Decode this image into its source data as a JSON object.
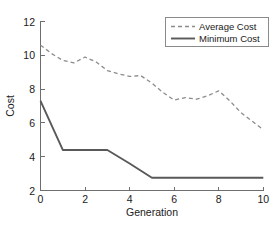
{
  "chart_data": {
    "type": "line",
    "title": "",
    "xlabel": "Generation",
    "ylabel": "Cost",
    "xlim": [
      0,
      10
    ],
    "ylim": [
      2,
      12
    ],
    "xticks": [
      0,
      2,
      4,
      6,
      8,
      10
    ],
    "yticks": [
      2,
      4,
      6,
      8,
      10,
      12
    ],
    "xtick_labels": [
      "0",
      "2",
      "4",
      "6",
      "8",
      "10"
    ],
    "ytick_labels": [
      "2",
      "4",
      "6",
      "8",
      "10",
      "12"
    ],
    "grid": false,
    "legend_position": "top-right",
    "series": [
      {
        "name": "Average Cost",
        "style": "dashed",
        "color": "#8c8c8c",
        "x": [
          0,
          0.5,
          1.0,
          1.5,
          2.0,
          2.5,
          3.0,
          3.5,
          4.0,
          4.5,
          5.0,
          5.5,
          6.0,
          6.5,
          7.0,
          7.5,
          8.0,
          8.5,
          9.0,
          9.5,
          10.0
        ],
        "values": [
          10.6,
          10.1,
          9.7,
          9.55,
          9.9,
          9.6,
          9.1,
          8.9,
          8.75,
          8.8,
          8.35,
          7.8,
          7.35,
          7.5,
          7.4,
          7.6,
          7.9,
          7.3,
          6.6,
          6.1,
          5.6
        ]
      },
      {
        "name": "Minimum Cost",
        "style": "solid",
        "color": "#595959",
        "x": [
          0,
          1,
          2,
          3,
          4,
          5,
          6,
          7,
          8,
          9,
          10
        ],
        "values": [
          7.3,
          4.4,
          4.4,
          4.4,
          3.6,
          2.75,
          2.75,
          2.75,
          2.75,
          2.75,
          2.75
        ]
      }
    ]
  },
  "legend": {
    "entries": [
      {
        "label": "Average Cost",
        "marker": "dashed-line-swatch"
      },
      {
        "label": "Minimum Cost",
        "marker": "solid-line-swatch"
      }
    ]
  },
  "colors": {
    "average_cost": "#8c8c8c",
    "minimum_cost": "#595959",
    "axis": "#6e6e6e",
    "text": "#1a1a1a",
    "background": "#ffffff"
  }
}
